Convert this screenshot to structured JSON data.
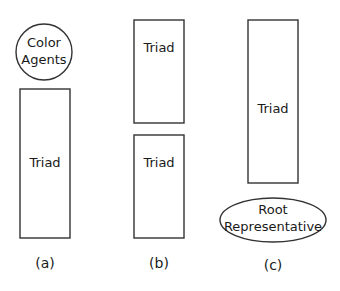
{
  "panels": [
    {
      "caption": "(a)",
      "circle": {
        "line1": "Color",
        "line2": "Agents"
      },
      "rect": {
        "label": "Triad"
      }
    },
    {
      "caption": "(b)",
      "rect_top": {
        "label": "Triad"
      },
      "rect_bottom": {
        "label": "Triad"
      }
    },
    {
      "caption": "(c)",
      "rect": {
        "label": "Triad"
      },
      "ellipse": {
        "line1": "Root",
        "line2": "Representative"
      }
    }
  ]
}
